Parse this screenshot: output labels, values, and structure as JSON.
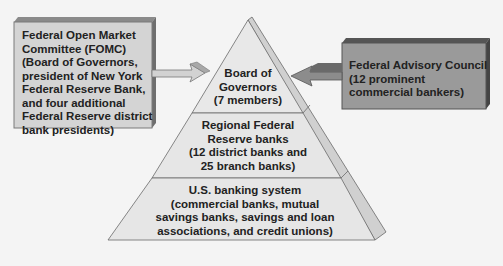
{
  "diagram": {
    "pyramid": {
      "tiers": [
        {
          "lines": [
            "Board of",
            "Governors",
            "(7 members)"
          ]
        },
        {
          "lines": [
            "Regional Federal",
            "Reserve banks",
            "(12 district banks and",
            "25 branch banks)"
          ]
        },
        {
          "lines": [
            "U.S. banking system",
            "(commercial banks, mutual",
            "savings banks, savings and loan",
            "associations, and credit unions)"
          ]
        }
      ]
    },
    "left_box": {
      "lines": [
        "Federal Open Market",
        "Committee (FOMC)",
        "(Board of Governors,",
        "president of New York",
        "Federal Reserve Bank,",
        "and four additional",
        "Federal Reserve district",
        "bank presidents)"
      ]
    },
    "right_box": {
      "lines": [
        "Federal Advisory Council",
        "(12 prominent",
        "commercial bankers)"
      ]
    },
    "colors": {
      "background": "#f4f4f4",
      "pyramid_face": "#e6e6e6",
      "pyramid_side": "#cfcfcf",
      "left_box": "#d4d4d4",
      "right_box": "#9a9a9a",
      "arrow_left": "#cfcfcf",
      "arrow_right": "#8c8c8c"
    }
  }
}
